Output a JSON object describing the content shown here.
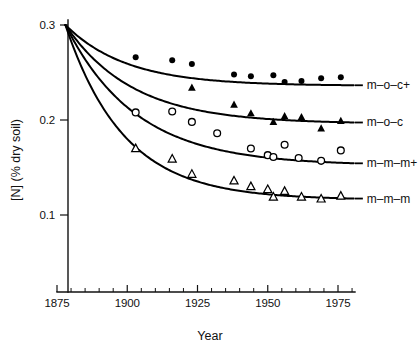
{
  "chart_data": {
    "type": "line",
    "title": "",
    "subtitle": "",
    "xlabel": "Year",
    "ylabel": "[N] (% dry soil)",
    "xlim": [
      1875,
      1980
    ],
    "ylim": [
      0.06,
      0.305
    ],
    "grid": false,
    "legend_position": "right-of-curve-ends",
    "x_ticks_major": [
      1875,
      1900,
      1925,
      1950,
      1975
    ],
    "x_tick_labels": [
      "1875",
      "1900",
      "1925",
      "1950",
      "1975"
    ],
    "x_ticks_minor": [
      1880,
      1885,
      1890,
      1895,
      1905,
      1910,
      1915,
      1920,
      1930,
      1935,
      1940,
      1945,
      1955,
      1960,
      1965,
      1970,
      1980
    ],
    "y_ticks_major": [
      0.1,
      0.2,
      0.3
    ],
    "y_tick_labels": [
      "0.1",
      "0.2",
      "0.3"
    ],
    "series": [
      {
        "name": "m-o-c+",
        "legend_label": "m–o–c+",
        "marker": "filled-circle",
        "asymptote": 0.236,
        "start_value": 0.3,
        "start_year": 1878,
        "decay_rate": 0.046,
        "points": [
          {
            "x": 1903,
            "y": 0.266
          },
          {
            "x": 1916,
            "y": 0.263
          },
          {
            "x": 1923,
            "y": 0.259
          },
          {
            "x": 1938,
            "y": 0.248
          },
          {
            "x": 1944,
            "y": 0.246
          },
          {
            "x": 1952,
            "y": 0.247
          },
          {
            "x": 1956,
            "y": 0.24
          },
          {
            "x": 1962,
            "y": 0.241
          },
          {
            "x": 1969,
            "y": 0.244
          },
          {
            "x": 1976,
            "y": 0.245
          }
        ]
      },
      {
        "name": "m-o-c",
        "legend_label": "m–o–c",
        "marker": "filled-triangle",
        "asymptote": 0.196,
        "start_value": 0.3,
        "start_year": 1878,
        "decay_rate": 0.042,
        "points": [
          {
            "x": 1923,
            "y": 0.234
          },
          {
            "x": 1938,
            "y": 0.216
          },
          {
            "x": 1944,
            "y": 0.207
          },
          {
            "x": 1952,
            "y": 0.198
          },
          {
            "x": 1956,
            "y": 0.204
          },
          {
            "x": 1962,
            "y": 0.203
          },
          {
            "x": 1969,
            "y": 0.191
          },
          {
            "x": 1976,
            "y": 0.199
          }
        ]
      },
      {
        "name": "m-m-m+",
        "legend_label": "m–m–m+",
        "marker": "open-circle",
        "asymptote": 0.152,
        "start_value": 0.3,
        "start_year": 1878,
        "decay_rate": 0.04,
        "points": [
          {
            "x": 1903,
            "y": 0.208
          },
          {
            "x": 1916,
            "y": 0.209
          },
          {
            "x": 1923,
            "y": 0.198
          },
          {
            "x": 1932,
            "y": 0.186
          },
          {
            "x": 1944,
            "y": 0.17
          },
          {
            "x": 1950,
            "y": 0.163
          },
          {
            "x": 1952,
            "y": 0.161
          },
          {
            "x": 1956,
            "y": 0.174
          },
          {
            "x": 1961,
            "y": 0.16
          },
          {
            "x": 1969,
            "y": 0.157
          },
          {
            "x": 1976,
            "y": 0.168
          }
        ]
      },
      {
        "name": "m-m-m",
        "legend_label": "m–m–m",
        "marker": "open-triangle",
        "asymptote": 0.116,
        "start_value": 0.3,
        "start_year": 1878,
        "decay_rate": 0.048,
        "points": [
          {
            "x": 1903,
            "y": 0.17
          },
          {
            "x": 1916,
            "y": 0.159
          },
          {
            "x": 1923,
            "y": 0.143
          },
          {
            "x": 1938,
            "y": 0.136
          },
          {
            "x": 1944,
            "y": 0.13
          },
          {
            "x": 1950,
            "y": 0.127
          },
          {
            "x": 1952,
            "y": 0.119
          },
          {
            "x": 1956,
            "y": 0.125
          },
          {
            "x": 1962,
            "y": 0.119
          },
          {
            "x": 1969,
            "y": 0.117
          },
          {
            "x": 1976,
            "y": 0.12
          }
        ]
      }
    ]
  },
  "axes": {
    "y_label": "[N] (% dry soil)",
    "x_label": "Year"
  },
  "legend": {
    "items": [
      {
        "label": "m–o–c+"
      },
      {
        "label": "m–o–c"
      },
      {
        "label": "m–m–m+"
      },
      {
        "label": "m–m–m"
      }
    ]
  },
  "colors": {
    "ink": "#111111",
    "curve": "#000000",
    "background": "#ffffff"
  }
}
